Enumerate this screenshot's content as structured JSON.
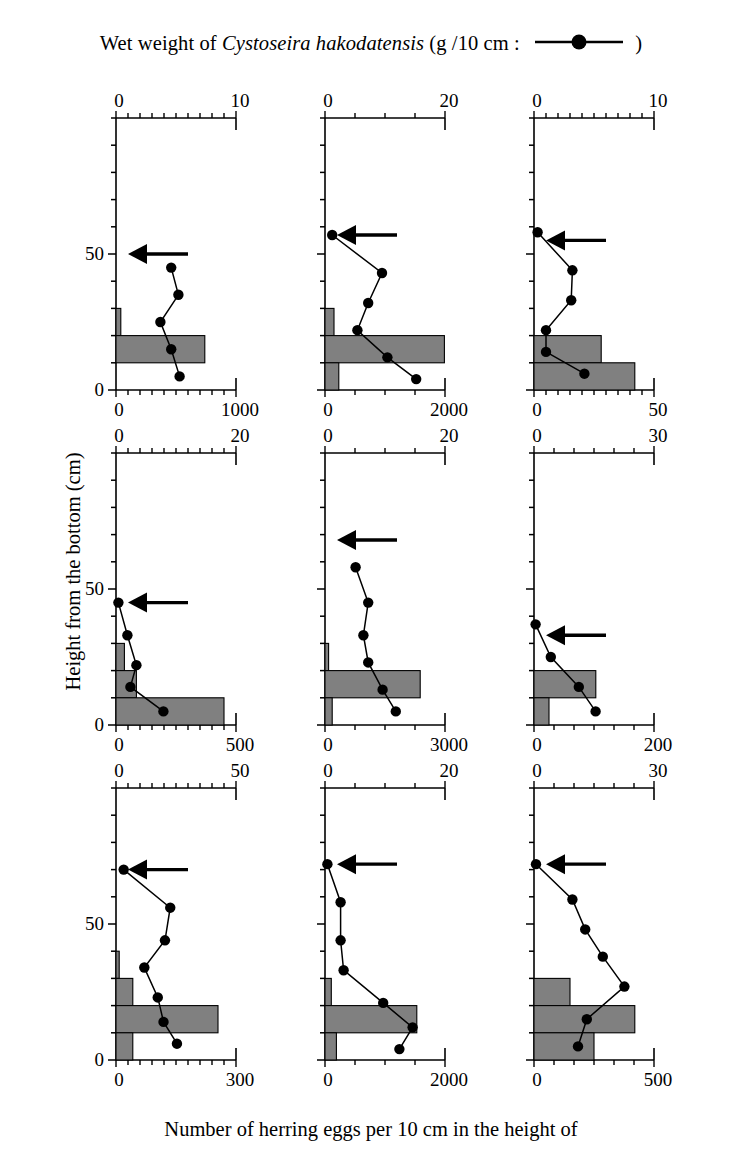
{
  "figure": {
    "top_axis_title_pre": "Wet weight of ",
    "top_axis_title_species": "Cystoseira hakodatensis",
    "top_axis_title_post": " (g /10 cm : ",
    "top_axis_title_end": " )",
    "bottom_axis_title": "Number of herring eggs per 10 cm in the height of",
    "y_axis_title": "Height from the bottom (cm)",
    "series_marker": "filled-circle-line",
    "bar_color": "#808080",
    "line_color": "#000000",
    "marker_color": "#000000",
    "arrow_color": "#000000",
    "arrow_meaning": "upper limit of herring egg deposition"
  },
  "y_axis": {
    "ticks": [
      "0",
      "50"
    ],
    "tick_values": [
      0,
      50
    ],
    "minor_step": 10,
    "min": 0,
    "max": 100
  },
  "chart_data": {
    "type": "bar",
    "xlabel": "Number of herring eggs per 10 cm in the height of",
    "ylabel": "Height from the bottom (cm)",
    "xlabel_top": "Wet weight of Cystoseira hakodatensis (g /10 cm)",
    "ylim": [
      0,
      100
    ],
    "grid": false,
    "legend": [
      "Wet weight of Cystoseira hakodatensis (g /10 cm)"
    ],
    "legend_position": "top-right",
    "panel_layout": "3 rows x 3 columns",
    "panels": [
      {
        "id": "panel-1",
        "row": 1,
        "col": 1,
        "top_axis": {
          "label_min": "0",
          "label_max": "10",
          "min": 0,
          "max": 10,
          "minor_ticks": 10
        },
        "bottom_axis": {
          "label_min": "0",
          "label_max": "1000",
          "min": 0,
          "max": 1000,
          "minor_ticks": 10
        },
        "arrow_height": 50,
        "bars": [
          {
            "height_bin_center": 25,
            "bin_low": 20,
            "bin_high": 30,
            "eggs": 40
          },
          {
            "height_bin_center": 15,
            "bin_low": 10,
            "bin_high": 20,
            "eggs": 740
          }
        ],
        "weight_series": {
          "heights": [
            45,
            35,
            25,
            15,
            5
          ],
          "values": [
            4.6,
            5.2,
            3.7,
            4.6,
            5.3
          ]
        }
      },
      {
        "id": "panel-2",
        "row": 1,
        "col": 2,
        "top_axis": {
          "label_min": "0",
          "label_max": "20",
          "min": 0,
          "max": 20,
          "minor_ticks": 4
        },
        "bottom_axis": {
          "label_min": "0",
          "label_max": "2000",
          "min": 0,
          "max": 2000,
          "minor_ticks": 4
        },
        "arrow_height": 57,
        "bars": [
          {
            "height_bin_center": 25,
            "bin_low": 20,
            "bin_high": 30,
            "eggs": 150
          },
          {
            "height_bin_center": 15,
            "bin_low": 10,
            "bin_high": 20,
            "eggs": 1990
          },
          {
            "height_bin_center": 5,
            "bin_low": 0,
            "bin_high": 10,
            "eggs": 230
          }
        ],
        "weight_series": {
          "heights": [
            57,
            43,
            32,
            22,
            12,
            4
          ],
          "values": [
            1.2,
            9.5,
            7.2,
            5.4,
            10.4,
            15.2
          ]
        }
      },
      {
        "id": "panel-3",
        "row": 1,
        "col": 3,
        "top_axis": {
          "label_min": "0",
          "label_max": "10",
          "min": 0,
          "max": 10,
          "minor_ticks": 10
        },
        "bottom_axis": {
          "label_min": "0",
          "label_max": "50",
          "min": 0,
          "max": 50,
          "minor_ticks": 10
        },
        "arrow_height": 55,
        "bars": [
          {
            "height_bin_center": 15,
            "bin_low": 10,
            "bin_high": 20,
            "eggs": 28
          },
          {
            "height_bin_center": 5,
            "bin_low": 0,
            "bin_high": 10,
            "eggs": 42
          }
        ],
        "weight_series": {
          "heights": [
            58,
            44,
            33,
            22,
            14,
            6
          ],
          "values": [
            0.3,
            3.2,
            3.1,
            1.0,
            1.0,
            4.2
          ]
        }
      },
      {
        "id": "panel-4",
        "row": 2,
        "col": 1,
        "top_axis": {
          "label_min": "0",
          "label_max": "20",
          "min": 0,
          "max": 20,
          "minor_ticks": 10
        },
        "bottom_axis": {
          "label_min": "0",
          "label_max": "500",
          "min": 0,
          "max": 500,
          "minor_ticks": 10
        },
        "arrow_height": 45,
        "bars": [
          {
            "height_bin_center": 25,
            "bin_low": 20,
            "bin_high": 30,
            "eggs": 35
          },
          {
            "height_bin_center": 15,
            "bin_low": 10,
            "bin_high": 20,
            "eggs": 85
          },
          {
            "height_bin_center": 5,
            "bin_low": 0,
            "bin_high": 10,
            "eggs": 450
          }
        ],
        "weight_series": {
          "heights": [
            45,
            33,
            22,
            14,
            5
          ],
          "values": [
            0.4,
            1.9,
            3.4,
            2.4,
            7.9
          ]
        }
      },
      {
        "id": "panel-5",
        "row": 2,
        "col": 2,
        "top_axis": {
          "label_min": "0",
          "label_max": "20",
          "min": 0,
          "max": 20,
          "minor_ticks": 4
        },
        "bottom_axis": {
          "label_min": "0",
          "label_max": "3000",
          "min": 0,
          "max": 3000,
          "minor_ticks": 4
        },
        "arrow_height": 68,
        "bars": [
          {
            "height_bin_center": 25,
            "bin_low": 20,
            "bin_high": 30,
            "eggs": 90
          },
          {
            "height_bin_center": 15,
            "bin_low": 10,
            "bin_high": 20,
            "eggs": 2380
          },
          {
            "height_bin_center": 5,
            "bin_low": 0,
            "bin_high": 10,
            "eggs": 180
          }
        ],
        "weight_series": {
          "heights": [
            58,
            45,
            33,
            23,
            13,
            5
          ],
          "values": [
            5.1,
            7.2,
            6.4,
            7.2,
            9.6,
            11.8
          ]
        }
      },
      {
        "id": "panel-6",
        "row": 2,
        "col": 3,
        "top_axis": {
          "label_min": "0",
          "label_max": "30",
          "min": 0,
          "max": 30,
          "minor_ticks": 6
        },
        "bottom_axis": {
          "label_min": "0",
          "label_max": "200",
          "min": 0,
          "max": 200,
          "minor_ticks": 6
        },
        "arrow_height": 33,
        "bars": [
          {
            "height_bin_center": 15,
            "bin_low": 10,
            "bin_high": 20,
            "eggs": 103
          },
          {
            "height_bin_center": 5,
            "bin_low": 0,
            "bin_high": 10,
            "eggs": 25
          }
        ],
        "weight_series": {
          "heights": [
            37,
            25,
            14,
            5
          ],
          "values": [
            0.4,
            4.2,
            11.2,
            15.4
          ]
        }
      },
      {
        "id": "panel-7",
        "row": 3,
        "col": 1,
        "top_axis": {
          "label_min": "0",
          "label_max": "50",
          "min": 0,
          "max": 50,
          "minor_ticks": 10
        },
        "bottom_axis": {
          "label_min": "0",
          "label_max": "300",
          "min": 0,
          "max": 300,
          "minor_ticks": 10
        },
        "arrow_height": 70,
        "bars": [
          {
            "height_bin_center": 35,
            "bin_low": 30,
            "bin_high": 40,
            "eggs": 8
          },
          {
            "height_bin_center": 25,
            "bin_low": 20,
            "bin_high": 30,
            "eggs": 42
          },
          {
            "height_bin_center": 15,
            "bin_low": 10,
            "bin_high": 20,
            "eggs": 255
          },
          {
            "height_bin_center": 5,
            "bin_low": 0,
            "bin_high": 10,
            "eggs": 42
          }
        ],
        "weight_series": {
          "heights": [
            70,
            56,
            44,
            34,
            23,
            14,
            6
          ],
          "values": [
            3.2,
            22.6,
            20.4,
            11.8,
            17.4,
            19.8,
            25.4
          ]
        }
      },
      {
        "id": "panel-8",
        "row": 3,
        "col": 2,
        "top_axis": {
          "label_min": "0",
          "label_max": "20",
          "min": 0,
          "max": 20,
          "minor_ticks": 4
        },
        "bottom_axis": {
          "label_min": "0",
          "label_max": "2000",
          "min": 0,
          "max": 2000,
          "minor_ticks": 4
        },
        "arrow_height": 72,
        "bars": [
          {
            "height_bin_center": 25,
            "bin_low": 20,
            "bin_high": 30,
            "eggs": 105
          },
          {
            "height_bin_center": 15,
            "bin_low": 10,
            "bin_high": 20,
            "eggs": 1530
          },
          {
            "height_bin_center": 5,
            "bin_low": 0,
            "bin_high": 10,
            "eggs": 190
          }
        ],
        "weight_series": {
          "heights": [
            72,
            58,
            44,
            33,
            21,
            12,
            4
          ],
          "values": [
            0.4,
            2.6,
            2.6,
            3.1,
            9.7,
            14.6,
            12.4
          ]
        }
      },
      {
        "id": "panel-9",
        "row": 3,
        "col": 3,
        "top_axis": {
          "label_min": "0",
          "label_max": "30",
          "min": 0,
          "max": 30,
          "minor_ticks": 6
        },
        "bottom_axis": {
          "label_min": "0",
          "label_max": "500",
          "min": 0,
          "max": 500,
          "minor_ticks": 6
        },
        "arrow_height": 72,
        "bars": [
          {
            "height_bin_center": 25,
            "bin_low": 20,
            "bin_high": 30,
            "eggs": 150
          },
          {
            "height_bin_center": 15,
            "bin_low": 10,
            "bin_high": 20,
            "eggs": 420
          },
          {
            "height_bin_center": 5,
            "bin_low": 0,
            "bin_high": 10,
            "eggs": 250
          }
        ],
        "weight_series": {
          "heights": [
            72,
            59,
            48,
            38,
            27,
            15,
            5
          ],
          "values": [
            0.5,
            9.6,
            12.8,
            17.2,
            22.6,
            13.2,
            11.0
          ]
        }
      }
    ]
  }
}
